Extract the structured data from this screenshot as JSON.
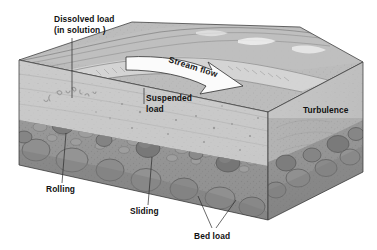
{
  "figure": {
    "title_alt": "Stream sediment transport block diagram",
    "background_color": "#ffffff"
  },
  "labels": {
    "dissolved_load_line1": "Dissolved load",
    "dissolved_load_line2": "(in solution )",
    "stream_flow": "Stream flow",
    "suspended_load_line1": "Suspended",
    "suspended_load_line2": "load",
    "turbulence": "Turbulence",
    "rolling": "Rolling",
    "sliding": "Sliding",
    "bed_load": "Bed load"
  },
  "colors": {
    "water": "#c9c9c9",
    "water_dark": "#b4b4b4",
    "bank_top": "#b9b9b9",
    "bank_light": "#d2d2d2",
    "sediment_front": "#8a8a8a",
    "sediment_dark": "#6f6f6f",
    "cobble_light": "#a6a6a6",
    "cobble_dark": "#7a7a7a",
    "arrow_fill": "#fbfbfb",
    "outline": "#3a3a3a",
    "text": "#111111"
  }
}
